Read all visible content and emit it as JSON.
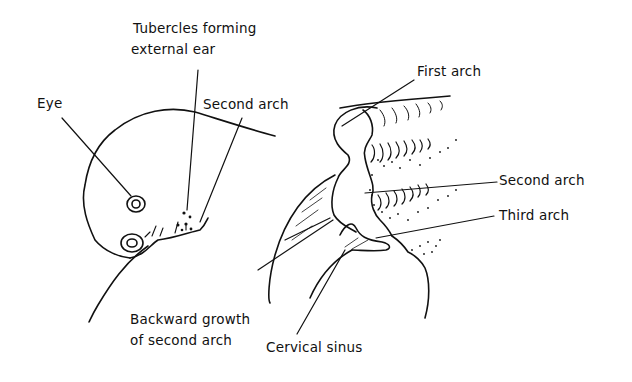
{
  "diagram": {
    "type": "anatomical-line-drawing",
    "panels": [
      {
        "name": "left-panel",
        "labels": {
          "tubercles_line1": "Tubercles forming",
          "tubercles_line2": "external ear",
          "eye": "Eye",
          "second_arch": "Second arch",
          "backward_line1": "Backward growth",
          "backward_line2": "of second arch"
        }
      },
      {
        "name": "right-panel",
        "labels": {
          "first_arch": "First arch",
          "second_arch": "Second arch",
          "third_arch": "Third arch",
          "cervical_sinus": "Cervical sinus"
        }
      }
    ],
    "colors": {
      "ink": "#111111",
      "background": "#ffffff"
    }
  }
}
